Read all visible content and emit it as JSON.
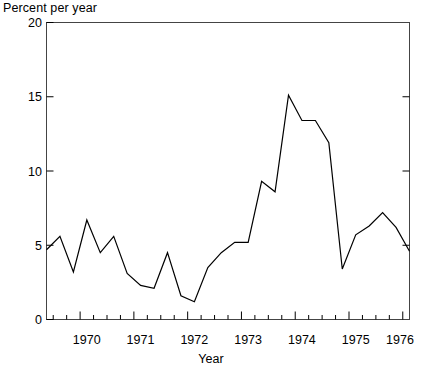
{
  "chart_data": {
    "type": "line",
    "title": "",
    "ylabel": "Percent per year",
    "xlabel": "Year",
    "ylim": [
      0,
      20
    ],
    "yticks": [
      0,
      5,
      10,
      15,
      20
    ],
    "ytick_labels": [
      "0",
      "5",
      "10",
      "15",
      "20"
    ],
    "xlim": [
      1969.375,
      1976.125
    ],
    "xticks": [
      1970,
      1971,
      1972,
      1973,
      1974,
      1975,
      1976
    ],
    "xtick_labels": [
      "1970",
      "1971",
      "1972",
      "1973",
      "1974",
      "1975",
      "1976"
    ],
    "minor_xtick_interval": 0.25,
    "grid": false,
    "legend": null,
    "line_color": "#000000",
    "line_width": 1.2,
    "x": [
      1969.375,
      1969.625,
      1969.875,
      1970.125,
      1970.375,
      1970.625,
      1970.875,
      1971.125,
      1971.375,
      1971.625,
      1971.875,
      1972.125,
      1972.375,
      1972.625,
      1972.875,
      1973.125,
      1973.375,
      1973.625,
      1973.875,
      1974.125,
      1974.375,
      1974.625,
      1974.875,
      1975.125,
      1975.375,
      1975.625,
      1975.875,
      1976.125
    ],
    "values": [
      4.7,
      5.6,
      3.2,
      6.7,
      4.5,
      5.6,
      3.1,
      2.3,
      2.1,
      4.5,
      1.6,
      1.2,
      3.5,
      4.5,
      5.2,
      5.2,
      9.3,
      8.6,
      15.1,
      13.4,
      13.4,
      11.9,
      3.4,
      5.7,
      6.3,
      7.2,
      6.2,
      4.6
    ],
    "series_name": "Percent per year"
  },
  "axes": {
    "y_axis_name": "percent-per-year-axis",
    "x_axis_name": "year-axis"
  }
}
